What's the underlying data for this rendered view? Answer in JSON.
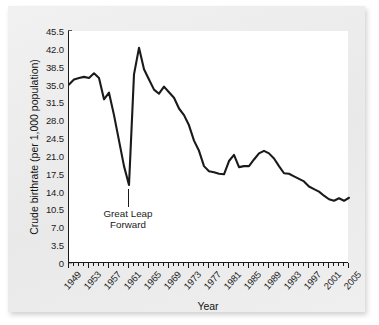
{
  "chart_data": {
    "type": "line",
    "title": "",
    "xlabel": "Year",
    "ylabel": "Crude birthrate (per 1,000 population)",
    "xlim": [
      1949,
      2005
    ],
    "ylim": [
      0,
      45.5
    ],
    "grid": false,
    "legend": null,
    "series_color": "#1a1a1a",
    "ytick_labels": [
      "45.5",
      "42.0",
      "38.5",
      "35.0",
      "31.5",
      "28.0",
      "24.5",
      "21.0",
      "17.5",
      "14.0",
      "10.5",
      "7.0",
      "3.5",
      "0"
    ],
    "ytick_values": [
      45.5,
      42.0,
      38.5,
      35.0,
      31.5,
      28.0,
      24.5,
      21.0,
      17.5,
      14.0,
      10.5,
      7.0,
      3.5,
      0
    ],
    "xtick_labels": [
      "1949",
      "1953",
      "1957",
      "1961",
      "1965",
      "1969",
      "1973",
      "1977",
      "1981",
      "1985",
      "1989",
      "1993",
      "1997",
      "2001",
      "2005"
    ],
    "xtick_values": [
      1949,
      1953,
      1957,
      1961,
      1965,
      1969,
      1973,
      1977,
      1981,
      1985,
      1989,
      1993,
      1997,
      2001,
      2005
    ],
    "x": [
      1949,
      1950,
      1951,
      1952,
      1953,
      1954,
      1955,
      1956,
      1957,
      1958,
      1959,
      1960,
      1961,
      1962,
      1963,
      1964,
      1965,
      1966,
      1967,
      1968,
      1969,
      1970,
      1971,
      1972,
      1973,
      1974,
      1975,
      1976,
      1977,
      1978,
      1979,
      1980,
      1981,
      1982,
      1983,
      1984,
      1985,
      1986,
      1987,
      1988,
      1989,
      1990,
      1991,
      1992,
      1993,
      1994,
      1995,
      1996,
      1997,
      1998,
      1999,
      2000,
      2001,
      2002,
      2003,
      2004,
      2005
    ],
    "values": [
      35.0,
      36.0,
      36.3,
      36.5,
      36.3,
      37.2,
      36.3,
      32.1,
      33.4,
      29.0,
      24.0,
      19.0,
      15.3,
      37.0,
      42.2,
      38.0,
      36.0,
      34.0,
      33.2,
      34.6,
      33.5,
      32.4,
      30.3,
      29.0,
      27.0,
      24.0,
      22.0,
      19.0,
      18.0,
      17.8,
      17.5,
      17.4,
      20.0,
      21.2,
      18.8,
      19.0,
      19.0,
      20.3,
      21.5,
      22.0,
      21.5,
      20.5,
      19.0,
      17.6,
      17.5,
      17.0,
      16.5,
      16.0,
      15.0,
      14.5,
      14.0,
      13.2,
      12.5,
      12.2,
      12.7,
      12.2,
      12.8
    ],
    "annotation": {
      "text_line1": "Great Leap",
      "text_line2": "Forward",
      "points_to_year": 1961
    }
  }
}
